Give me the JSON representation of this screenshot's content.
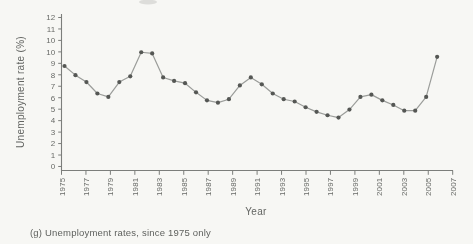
{
  "page": {
    "caption": "(g) Unemployment rates, since 1975 only"
  },
  "chart_data": {
    "type": "line",
    "title": "",
    "xlabel": "Year",
    "ylabel": "Unemployment rate (%)",
    "x": [
      1975,
      1976,
      1977,
      1978,
      1979,
      1980,
      1981,
      1982,
      1983,
      1984,
      1985,
      1986,
      1987,
      1988,
      1989,
      1990,
      1991,
      1992,
      1993,
      1994,
      1995,
      1996,
      1997,
      1998,
      1999,
      2000,
      2001,
      2002,
      2003,
      2004,
      2005,
      2006,
      2007,
      2008,
      2009
    ],
    "values": [
      8.5,
      7.7,
      7.1,
      6.1,
      5.8,
      7.1,
      7.6,
      9.7,
      9.6,
      7.5,
      7.2,
      7.0,
      6.2,
      5.5,
      5.3,
      5.6,
      6.8,
      7.5,
      6.9,
      6.1,
      5.6,
      5.4,
      4.9,
      4.5,
      4.2,
      4.0,
      4.7,
      5.8,
      6.0,
      5.5,
      5.1,
      4.6,
      4.6,
      5.8,
      9.3
    ],
    "x_tick_labels": [
      "1975",
      "1977",
      "1979",
      "1981",
      "1983",
      "1985",
      "1987",
      "1989",
      "1991",
      "1993",
      "1995",
      "1997",
      "1999",
      "2001",
      "2003",
      "2005",
      "2007"
    ],
    "y_tick_labels_top_to_bottom": [
      "12",
      "11",
      "10",
      "10",
      "9",
      "8",
      "7",
      "6",
      "5",
      "4",
      "3",
      "2",
      "1",
      "0"
    ],
    "ylim": [
      0,
      12
    ],
    "grid": false,
    "legend": "none",
    "marker": "filled-circle",
    "colors": {
      "line": "#9b9d9a",
      "marker": "#555754",
      "axis": "#7c7e7b",
      "text": "#686a67",
      "background": "#f7f7f4"
    }
  }
}
